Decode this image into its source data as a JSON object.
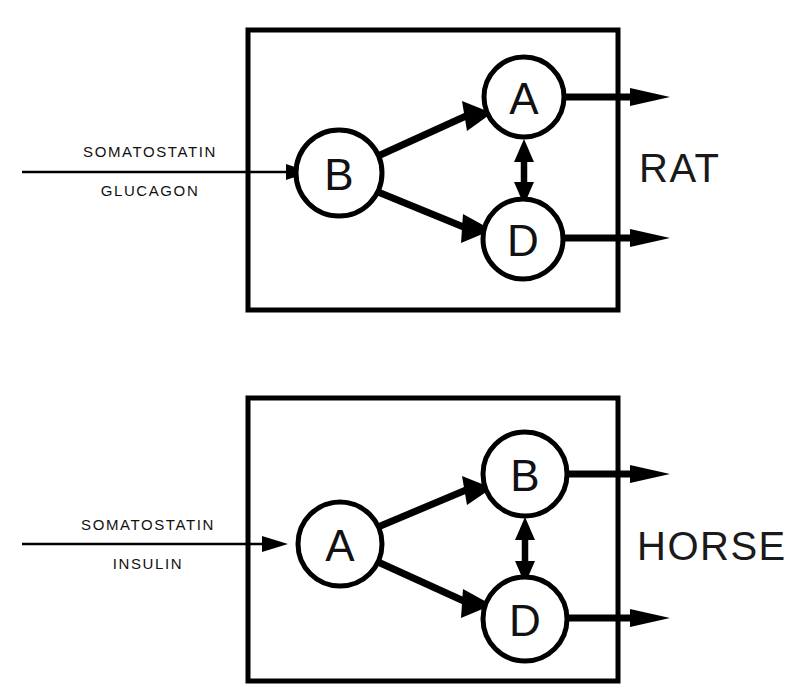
{
  "figure": {
    "title": "",
    "background_color": "#ffffff",
    "line_color": "#000000",
    "panels": [
      {
        "id": "rat-panel",
        "species_label": "RAT",
        "input_labels": {
          "top": "SOMATOSTATIN",
          "bottom": "GLUCAGON"
        },
        "nodes": [
          {
            "id": "rat-node-source",
            "label": "B",
            "role": "source",
            "position": "left-center"
          },
          {
            "id": "rat-node-upper",
            "label": "A",
            "role": "target-upper",
            "position": "right-upper"
          },
          {
            "id": "rat-node-lower",
            "label": "D",
            "role": "target-lower",
            "position": "right-lower"
          }
        ],
        "edges": [
          {
            "from": "B",
            "to": "A",
            "style": "thick-single-arrow"
          },
          {
            "from": "B",
            "to": "D",
            "style": "thick-single-arrow"
          },
          {
            "from": "A",
            "to": "D",
            "style": "thick-double-arrow"
          },
          {
            "from": "A",
            "to": "output",
            "style": "thick-single-arrow"
          },
          {
            "from": "D",
            "to": "output",
            "style": "thick-single-arrow"
          },
          {
            "from": "input",
            "to": "B",
            "style": "thin-single-arrow"
          }
        ]
      },
      {
        "id": "horse-panel",
        "species_label": "HORSE",
        "input_labels": {
          "top": "SOMATOSTATIN",
          "bottom": "INSULIN"
        },
        "nodes": [
          {
            "id": "horse-node-source",
            "label": "A",
            "role": "source",
            "position": "left-center"
          },
          {
            "id": "horse-node-upper",
            "label": "B",
            "role": "target-upper",
            "position": "right-upper"
          },
          {
            "id": "horse-node-lower",
            "label": "D",
            "role": "target-lower",
            "position": "right-lower"
          }
        ],
        "edges": [
          {
            "from": "A",
            "to": "B",
            "style": "thick-single-arrow"
          },
          {
            "from": "A",
            "to": "D",
            "style": "thick-single-arrow"
          },
          {
            "from": "B",
            "to": "D",
            "style": "thick-double-arrow"
          },
          {
            "from": "B",
            "to": "output",
            "style": "thick-single-arrow"
          },
          {
            "from": "D",
            "to": "output",
            "style": "thick-single-arrow"
          },
          {
            "from": "input",
            "to": "A",
            "style": "thin-single-arrow"
          }
        ]
      }
    ]
  },
  "rat": {
    "species": "RAT",
    "input_top": "SOMATOSTATIN",
    "input_bottom": "GLUCAGON",
    "node_source": "B",
    "node_upper": "A",
    "node_lower": "D"
  },
  "horse": {
    "species": "HORSE",
    "input_top": "SOMATOSTATIN",
    "input_bottom": "INSULIN",
    "node_source": "A",
    "node_upper": "B",
    "node_lower": "D"
  }
}
